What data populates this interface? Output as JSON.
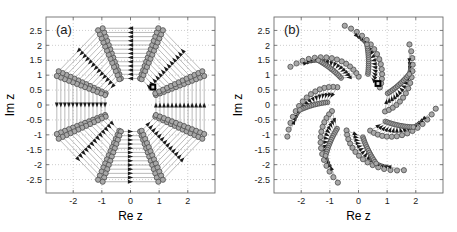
{
  "figure": {
    "background": "#ffffff",
    "panels": [
      {
        "tag": "(a)",
        "xlabel": "Re z",
        "ylabel": "Im z",
        "xticks": [
          "-2",
          "-1",
          "0",
          "1",
          "2"
        ],
        "xtick_values": [
          -2,
          -1,
          0,
          1,
          2
        ],
        "yticks": [
          "2.5",
          "2",
          "1.5",
          "1",
          "0.5",
          "0",
          "-0.5",
          "-1",
          "-1.5",
          "-2",
          "-2.5"
        ],
        "ytick_values": [
          2.5,
          2,
          1.5,
          1,
          0.5,
          0,
          -0.5,
          -1,
          -1.5,
          -2,
          -2.5
        ],
        "xlim": [
          -2.95,
          2.95
        ],
        "ylim": [
          -2.95,
          2.95
        ],
        "grid": true,
        "symmetry_order": 8,
        "arm_style": "radial-straight",
        "spiral_twist_deg": 0,
        "inner_radius": 0.95,
        "outer_radius": 2.75,
        "markers_per_arm": 13,
        "marker_shape": "circle",
        "marker_face": "#a8a8a8",
        "marker_edge": "#4d4d4d",
        "line_color": "#8c8c8c",
        "arrow_color": "#1a1a1a",
        "highlight_marker": {
          "shape": "square",
          "color": "#000000",
          "re": 0.78,
          "im": 0.6
        }
      },
      {
        "tag": "(b)",
        "xlabel": "Re z",
        "ylabel": "Im z",
        "xticks": [
          "-2",
          "-1",
          "0",
          "1",
          "2"
        ],
        "xtick_values": [
          -2,
          -1,
          0,
          1,
          2
        ],
        "yticks": [
          "2.5",
          "2",
          "1.5",
          "1",
          "0.5",
          "0",
          "-0.5",
          "-1",
          "-1.5",
          "-2",
          "-2.5"
        ],
        "ytick_values": [
          2.5,
          2,
          1.5,
          1,
          0.5,
          0,
          -0.5,
          -1,
          -1.5,
          -2,
          -2.5
        ],
        "xlim": [
          -2.95,
          2.95
        ],
        "ylim": [
          -2.95,
          2.95
        ],
        "grid": true,
        "symmetry_order": 7,
        "arm_style": "spiral-swept",
        "spiral_twist_deg": 62,
        "inner_radius": 0.95,
        "outer_radius": 2.7,
        "markers_per_arm": 15,
        "marker_shape": "circle",
        "marker_face": "#a8a8a8",
        "marker_edge": "#4d4d4d",
        "line_color": "#8c8c8c",
        "arrow_color": "#1a1a1a",
        "highlight_marker": {
          "shape": "square",
          "color": "#000000",
          "re": 0.68,
          "im": 0.72
        }
      }
    ]
  },
  "chart_data": {
    "type": "scatter",
    "title": "",
    "xlabel": "Re z",
    "ylabel": "Im z",
    "xlim": [
      -2.95,
      2.95
    ],
    "ylim": [
      -2.95,
      2.95
    ],
    "grid": true,
    "legend": "none",
    "panels": [
      {
        "label": "(a)",
        "description": "Eight-fold symmetric arrangement of complex roots; straight chord rays of circle markers emanating outward from a circular void of radius about 1, each chord decorated with arrowheads indicating flow direction.",
        "symmetry_order": 8,
        "radial_range": [
          0.95,
          2.75
        ],
        "angular_offset_deg": 0,
        "twist_deg": 0,
        "chords_per_sector": 13,
        "highlight_point": {
          "re": 0.78,
          "im": 0.6
        }
      },
      {
        "label": "(b)",
        "description": "Seven-fold pinwheel of complex roots; arms are swept/curved anticlockwise producing a spiral appearance around a central void of radius about 1, arrowheads along each arm.",
        "symmetry_order": 7,
        "radial_range": [
          0.95,
          2.7
        ],
        "angular_offset_deg": 12,
        "twist_deg": 62,
        "chords_per_sector": 15,
        "highlight_point": {
          "re": 0.68,
          "im": 0.72
        }
      }
    ]
  }
}
